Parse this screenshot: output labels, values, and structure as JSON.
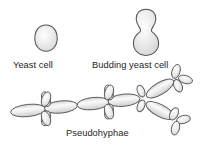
{
  "figure": {
    "background_color": "#ffffff",
    "outline_color": "#4a4a4a",
    "fill_color": "#e9e9e9",
    "highlight_color": "#fbfbfb",
    "text_color": "#1d1d1d"
  },
  "labels": {
    "yeast_cell": "Yeast cell",
    "budding_yeast_cell": "Budding yeast cell",
    "pseudohyphae": "Pseudohyphae"
  },
  "shapes": {
    "yeast_cell": {
      "name": "single ovoid yeast cell",
      "cx": 46,
      "cy": 38,
      "rx": 11,
      "ry": 13
    },
    "budding_yeast_cell": {
      "name": "mother cell with attached bud",
      "mother": {
        "cx": 146,
        "cy": 40,
        "rx": 13,
        "ry": 14
      },
      "bud": {
        "cx": 146,
        "cy": 19,
        "rx": 9.5,
        "ry": 9.5
      }
    },
    "pseudohyphae": {
      "name": "chain of elongated pseudohyphal cells with blastoconidia clusters",
      "cell_count": 7,
      "cluster_count": 5,
      "chain_angle_deg": -7
    }
  }
}
